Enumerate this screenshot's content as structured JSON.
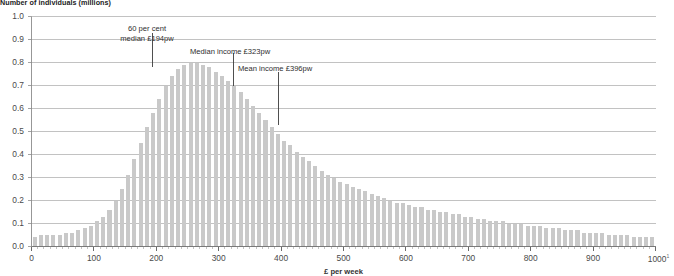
{
  "chart_data": {
    "type": "bar",
    "title": "Number of individuals (millions)",
    "subtitle": "",
    "xlabel": "£ per week",
    "ylabel": "Number of individuals (millions)",
    "xlim": [
      0,
      1000
    ],
    "ylim": [
      0,
      1.0
    ],
    "grid": true,
    "legend_position": "none",
    "bin_width": 10,
    "x_tick_labels": [
      "0",
      "100",
      "200",
      "300",
      "400",
      "500",
      "600",
      "700",
      "800",
      "900",
      "1000"
    ],
    "x_tick_values": [
      0,
      100,
      200,
      300,
      400,
      500,
      600,
      700,
      800,
      900,
      1000
    ],
    "x_last_tick_footnote": "1",
    "y_tick_labels": [
      "0.0",
      "0.1",
      "0.2",
      "0.3",
      "0.4",
      "0.5",
      "0.6",
      "0.7",
      "0.8",
      "0.9",
      "1.0"
    ],
    "y_tick_values": [
      0.0,
      0.1,
      0.2,
      0.3,
      0.4,
      0.5,
      0.6,
      0.7,
      0.8,
      0.9,
      1.0
    ],
    "bar_color": "#c9c9c9",
    "gridline_color": "#9a9a9a",
    "axis_color": "#8c8c8c",
    "x": [
      5,
      15,
      25,
      35,
      45,
      55,
      65,
      75,
      85,
      95,
      105,
      115,
      125,
      135,
      145,
      155,
      165,
      175,
      185,
      195,
      205,
      215,
      225,
      235,
      245,
      255,
      265,
      275,
      285,
      295,
      305,
      315,
      325,
      335,
      345,
      355,
      365,
      375,
      385,
      395,
      405,
      415,
      425,
      435,
      445,
      455,
      465,
      475,
      485,
      495,
      505,
      515,
      525,
      535,
      545,
      555,
      565,
      575,
      585,
      595,
      605,
      615,
      625,
      635,
      645,
      655,
      665,
      675,
      685,
      695,
      705,
      715,
      725,
      735,
      745,
      755,
      765,
      775,
      785,
      795,
      805,
      815,
      825,
      835,
      845,
      855,
      865,
      875,
      885,
      895,
      905,
      915,
      925,
      935,
      945,
      955,
      965,
      975,
      985,
      995
    ],
    "values": [
      0.04,
      0.05,
      0.05,
      0.05,
      0.05,
      0.06,
      0.06,
      0.07,
      0.08,
      0.09,
      0.11,
      0.13,
      0.16,
      0.2,
      0.25,
      0.31,
      0.38,
      0.45,
      0.52,
      0.58,
      0.64,
      0.7,
      0.74,
      0.77,
      0.79,
      0.8,
      0.8,
      0.79,
      0.78,
      0.76,
      0.74,
      0.72,
      0.7,
      0.67,
      0.64,
      0.61,
      0.58,
      0.55,
      0.52,
      0.49,
      0.46,
      0.44,
      0.41,
      0.39,
      0.37,
      0.35,
      0.33,
      0.31,
      0.3,
      0.28,
      0.27,
      0.26,
      0.25,
      0.24,
      0.23,
      0.22,
      0.21,
      0.2,
      0.19,
      0.19,
      0.18,
      0.17,
      0.17,
      0.16,
      0.16,
      0.15,
      0.15,
      0.14,
      0.14,
      0.13,
      0.13,
      0.12,
      0.12,
      0.11,
      0.11,
      0.11,
      0.1,
      0.1,
      0.1,
      0.09,
      0.09,
      0.09,
      0.08,
      0.08,
      0.08,
      0.07,
      0.07,
      0.07,
      0.06,
      0.06,
      0.06,
      0.06,
      0.05,
      0.05,
      0.05,
      0.05,
      0.04,
      0.04,
      0.04,
      0.04
    ],
    "annotations": [
      {
        "id": "low-income-threshold",
        "line1": "60 per cent",
        "line2": "median £194pw",
        "x_value": 194,
        "marker_top": 0.93,
        "marker_bottom": 0.78
      },
      {
        "id": "median-income",
        "line1": "Median income £323pw",
        "line2": "",
        "x_value": 323,
        "marker_top": 0.84,
        "marker_bottom": 0.7
      },
      {
        "id": "mean-income",
        "line1": "Mean income £396pw",
        "line2": "",
        "x_value": 396,
        "marker_top": 0.76,
        "marker_bottom": 0.53
      }
    ]
  }
}
